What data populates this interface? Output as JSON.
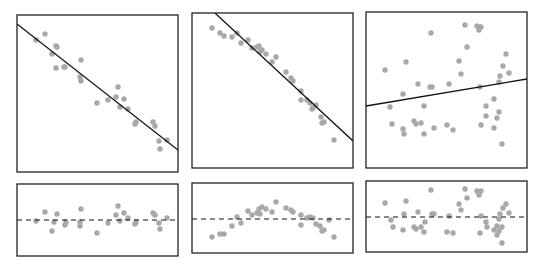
{
  "colors": {
    "frame": "#222222",
    "dot": "#a8a8a8",
    "line": "#111111",
    "background": "#ffffff"
  },
  "chart_data": [
    {
      "type": "scatter",
      "title": "",
      "panel": "top-left",
      "box": [
        17,
        15,
        178,
        172
      ],
      "fit_line": {
        "x1": 17,
        "y1": 24,
        "x2": 178,
        "y2": 150,
        "style": "solid"
      },
      "points": [
        [
          36,
          40
        ],
        [
          45,
          34
        ],
        [
          56,
          46
        ],
        [
          57,
          47
        ],
        [
          52,
          54
        ],
        [
          56,
          68
        ],
        [
          65,
          67
        ],
        [
          64,
          67
        ],
        [
          81,
          60
        ],
        [
          80,
          77
        ],
        [
          81,
          81
        ],
        [
          97,
          103
        ],
        [
          108,
          100
        ],
        [
          116,
          97
        ],
        [
          118,
          87
        ],
        [
          120,
          107
        ],
        [
          124,
          99
        ],
        [
          128,
          109
        ],
        [
          135,
          124
        ],
        [
          136,
          122
        ],
        [
          153,
          122
        ],
        [
          155,
          126
        ],
        [
          159,
          141
        ],
        [
          160,
          149
        ],
        [
          167,
          140
        ]
      ]
    },
    {
      "type": "scatter",
      "title": "",
      "panel": "top-middle",
      "box": [
        192,
        13,
        353,
        168
      ],
      "fit_line": {
        "x1": 215,
        "y1": 13,
        "x2": 353,
        "y2": 141,
        "style": "solid"
      },
      "points": [
        [
          212,
          28
        ],
        [
          220,
          33
        ],
        [
          224,
          36
        ],
        [
          232,
          37
        ],
        [
          237,
          33
        ],
        [
          241,
          43
        ],
        [
          248,
          40
        ],
        [
          252,
          48
        ],
        [
          257,
          47
        ],
        [
          259,
          46
        ],
        [
          260,
          52
        ],
        [
          262,
          50
        ],
        [
          266,
          54
        ],
        [
          272,
          62
        ],
        [
          276,
          57
        ],
        [
          286,
          72
        ],
        [
          291,
          78
        ],
        [
          293,
          81
        ],
        [
          301,
          91
        ],
        [
          301,
          100
        ],
        [
          307,
          100
        ],
        [
          310,
          103
        ],
        [
          313,
          108
        ],
        [
          316,
          105
        ],
        [
          312,
          109
        ],
        [
          321,
          117
        ],
        [
          322,
          123
        ],
        [
          324,
          122
        ],
        [
          334,
          140
        ]
      ]
    },
    {
      "type": "scatter",
      "title": "",
      "panel": "top-right",
      "box": [
        366,
        12,
        527,
        168
      ],
      "fit_line": {
        "x1": 366,
        "y1": 106,
        "x2": 527,
        "y2": 79,
        "style": "solid"
      },
      "points": [
        [
          385,
          70
        ],
        [
          406,
          62
        ],
        [
          431,
          33
        ],
        [
          465,
          25
        ],
        [
          477,
          26
        ],
        [
          479,
          30
        ],
        [
          481,
          27
        ],
        [
          467,
          47
        ],
        [
          459,
          61
        ],
        [
          461,
          74
        ],
        [
          418,
          84
        ],
        [
          430,
          87
        ],
        [
          432,
          87
        ],
        [
          449,
          84
        ],
        [
          403,
          94
        ],
        [
          390,
          107
        ],
        [
          424,
          106
        ],
        [
          392,
          124
        ],
        [
          403,
          129
        ],
        [
          414,
          121
        ],
        [
          416,
          124
        ],
        [
          421,
          123
        ],
        [
          404,
          134
        ],
        [
          424,
          134
        ],
        [
          434,
          128
        ],
        [
          447,
          125
        ],
        [
          453,
          130
        ],
        [
          506,
          54
        ],
        [
          503,
          66
        ],
        [
          509,
          73
        ],
        [
          500,
          76
        ],
        [
          499,
          82
        ],
        [
          494,
          99
        ],
        [
          486,
          106
        ],
        [
          486,
          116
        ],
        [
          499,
          112
        ],
        [
          497,
          118
        ],
        [
          481,
          125
        ],
        [
          494,
          128
        ],
        [
          502,
          144
        ],
        [
          480,
          87
        ]
      ]
    },
    {
      "type": "scatter",
      "title": "",
      "panel": "bottom-left-residuals",
      "box": [
        17,
        184,
        178,
        256
      ],
      "zero_line": {
        "y": 220,
        "style": "dashed"
      },
      "points": [
        [
          36,
          221
        ],
        [
          45,
          212
        ],
        [
          52,
          231
        ],
        [
          54,
          222
        ],
        [
          57,
          214
        ],
        [
          65,
          225
        ],
        [
          66,
          222
        ],
        [
          80,
          222
        ],
        [
          80,
          226
        ],
        [
          81,
          209
        ],
        [
          97,
          233
        ],
        [
          108,
          223
        ],
        [
          116,
          215
        ],
        [
          118,
          206
        ],
        [
          120,
          221
        ],
        [
          124,
          213
        ],
        [
          128,
          218
        ],
        [
          135,
          224
        ],
        [
          136,
          222
        ],
        [
          153,
          213
        ],
        [
          155,
          215
        ],
        [
          159,
          223
        ],
        [
          160,
          229
        ],
        [
          167,
          218
        ]
      ]
    },
    {
      "type": "scatter",
      "title": "",
      "panel": "bottom-middle-residuals",
      "box": [
        192,
        183,
        353,
        253
      ],
      "zero_line": {
        "y": 219,
        "style": "dashed"
      },
      "points": [
        [
          212,
          237
        ],
        [
          220,
          234
        ],
        [
          224,
          234
        ],
        [
          232,
          226
        ],
        [
          237,
          217
        ],
        [
          241,
          223
        ],
        [
          248,
          211
        ],
        [
          252,
          215
        ],
        [
          257,
          213
        ],
        [
          259,
          209
        ],
        [
          260,
          214
        ],
        [
          262,
          207
        ],
        [
          266,
          209
        ],
        [
          272,
          212
        ],
        [
          276,
          202
        ],
        [
          286,
          208
        ],
        [
          291,
          210
        ],
        [
          293,
          212
        ],
        [
          301,
          215
        ],
        [
          301,
          225
        ],
        [
          307,
          218
        ],
        [
          310,
          217
        ],
        [
          313,
          218
        ],
        [
          316,
          224
        ],
        [
          320,
          226
        ],
        [
          322,
          231
        ],
        [
          324,
          230
        ],
        [
          334,
          237
        ],
        [
          329,
          220
        ]
      ]
    },
    {
      "type": "scatter",
      "title": "",
      "panel": "bottom-right-residuals",
      "box": [
        366,
        181,
        527,
        252
      ],
      "zero_line": {
        "y": 217,
        "style": "dashed"
      },
      "points": [
        [
          385,
          203
        ],
        [
          391,
          220
        ],
        [
          393,
          227
        ],
        [
          403,
          230
        ],
        [
          404,
          214
        ],
        [
          406,
          201
        ],
        [
          414,
          227
        ],
        [
          416,
          229
        ],
        [
          418,
          212
        ],
        [
          421,
          227
        ],
        [
          424,
          232
        ],
        [
          425,
          222
        ],
        [
          431,
          190
        ],
        [
          432,
          214
        ],
        [
          434,
          214
        ],
        [
          447,
          232
        ],
        [
          449,
          216
        ],
        [
          453,
          233
        ],
        [
          459,
          204
        ],
        [
          461,
          210
        ],
        [
          465,
          189
        ],
        [
          467,
          198
        ],
        [
          477,
          191
        ],
        [
          479,
          195
        ],
        [
          481,
          191
        ],
        [
          481,
          216
        ],
        [
          480,
          233
        ],
        [
          486,
          222
        ],
        [
          487,
          227
        ],
        [
          494,
          230
        ],
        [
          497,
          235
        ],
        [
          499,
          231
        ],
        [
          499,
          219
        ],
        [
          500,
          214
        ],
        [
          502,
          227
        ],
        [
          503,
          208
        ],
        [
          506,
          204
        ],
        [
          509,
          213
        ],
        [
          502,
          243
        ],
        [
          497,
          226
        ]
      ]
    }
  ]
}
